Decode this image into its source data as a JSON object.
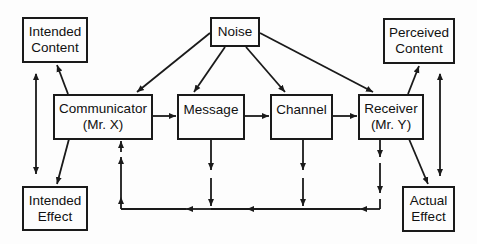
{
  "diagram": {
    "type": "communication-model",
    "colors": {
      "line": "#1a1a1a",
      "background": "#fdfdfd",
      "text": "#111111"
    },
    "nodes": {
      "intended_content": {
        "line1": "Intended",
        "line2": "Content"
      },
      "noise": {
        "line1": "Noise"
      },
      "perceived_content": {
        "line1": "Perceived",
        "line2": "Content"
      },
      "communicator": {
        "line1": "Communicator",
        "line2": "(Mr. X)"
      },
      "message": {
        "line1": "Message"
      },
      "channel": {
        "line1": "Channel"
      },
      "receiver": {
        "line1": "Receiver",
        "line2": "(Mr. Y)"
      },
      "intended_effect": {
        "line1": "Intended",
        "line2": "Effect"
      },
      "actual_effect": {
        "line1": "Actual",
        "line2": "Effect"
      }
    },
    "edges": [
      {
        "from": "communicator",
        "to": "intended_content"
      },
      {
        "from": "communicator",
        "to": "intended_effect"
      },
      {
        "from": "intended_content",
        "to": "intended_effect",
        "bidirectional": true
      },
      {
        "from": "noise",
        "to": "communicator"
      },
      {
        "from": "noise",
        "to": "message"
      },
      {
        "from": "noise",
        "to": "channel"
      },
      {
        "from": "noise",
        "to": "receiver"
      },
      {
        "from": "communicator",
        "to": "message"
      },
      {
        "from": "message",
        "to": "channel"
      },
      {
        "from": "channel",
        "to": "receiver"
      },
      {
        "from": "receiver",
        "to": "perceived_content"
      },
      {
        "from": "receiver",
        "to": "actual_effect"
      },
      {
        "from": "perceived_content",
        "to": "actual_effect",
        "bidirectional": true
      },
      {
        "from": "receiver",
        "to": "communicator",
        "style": "dashed-feedback"
      },
      {
        "from": "channel",
        "to": "communicator",
        "style": "dashed-feedback"
      },
      {
        "from": "message",
        "to": "communicator",
        "style": "dashed-feedback"
      }
    ]
  }
}
